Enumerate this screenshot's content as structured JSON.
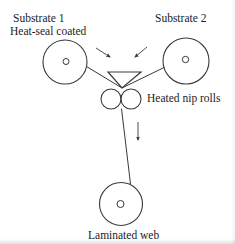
{
  "diagram": {
    "labels": {
      "substrate1_line1": "Substrate 1",
      "substrate1_line2": "Heat-seal coated",
      "substrate2": "Substrate 2",
      "nip_rolls": "Heated nip rolls",
      "laminated_web": "Laminated web"
    },
    "colors": {
      "line": "#3a3a3a",
      "text": "#1c1c1c",
      "background": "#ffffff"
    }
  }
}
